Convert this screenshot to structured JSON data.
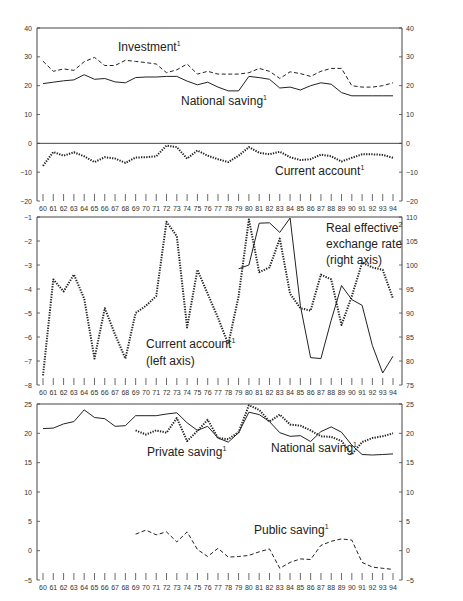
{
  "chart_data": [
    {
      "type": "line",
      "panel": "top",
      "title": "",
      "x": [
        60,
        61,
        62,
        63,
        64,
        65,
        66,
        67,
        68,
        69,
        70,
        71,
        72,
        73,
        74,
        75,
        76,
        77,
        78,
        79,
        80,
        81,
        82,
        83,
        84,
        85,
        86,
        87,
        88,
        89,
        90,
        91,
        92,
        93,
        94
      ],
      "xlabel": "",
      "ylabel": "",
      "ylim": [
        -20,
        40
      ],
      "yticks": [
        -20,
        -10,
        0,
        10,
        20,
        30,
        40
      ],
      "right_yticks": [
        -20,
        -10,
        0,
        10,
        20,
        30,
        40
      ],
      "series": [
        {
          "name": "Investment",
          "label": "Investment",
          "footnote": "1",
          "style": "dashed",
          "values": [
            28.5,
            25,
            25.8,
            25.3,
            28.3,
            29.8,
            27,
            27,
            28.8,
            28.4,
            28,
            27.5,
            24.5,
            25.5,
            27.5,
            24,
            25,
            24,
            24,
            24,
            24.5,
            26,
            25,
            22.5,
            24.8,
            24.2,
            23.2,
            25,
            26,
            26,
            20,
            19.5,
            19.5,
            20,
            21
          ]
        },
        {
          "name": "National saving",
          "label": "National saving",
          "footnote": "1",
          "style": "solid",
          "values": [
            20.7,
            21.2,
            21.7,
            22,
            23.8,
            22.2,
            22.5,
            21.3,
            21,
            22.8,
            23,
            23,
            23.2,
            23.2,
            21.6,
            20.3,
            21.2,
            19.5,
            18.2,
            18.2,
            23.2,
            22.8,
            22.2,
            19.2,
            19.5,
            18.5,
            20,
            21,
            20.5,
            17.6,
            16.5,
            16.5,
            16.5,
            16.5,
            16.5
          ]
        },
        {
          "name": "Current account",
          "label": "Current account",
          "footnote": "1",
          "style": "dotted",
          "values": [
            -7.8,
            -3,
            -4.3,
            -3.1,
            -4.5,
            -6.5,
            -4.8,
            -5.3,
            -6.8,
            -4.9,
            -4.8,
            -4.5,
            -0.8,
            -1.3,
            -5.3,
            -2.5,
            -4.3,
            -5.5,
            -6.5,
            -4.3,
            -1.3,
            -3.3,
            -3.8,
            -2.9,
            -4.8,
            -5.8,
            -5.5,
            -3.9,
            -4.5,
            -6.3,
            -5,
            -3.8,
            -3.8,
            -4,
            -5
          ]
        }
      ]
    },
    {
      "type": "line",
      "panel": "middle",
      "title": "",
      "x": [
        60,
        61,
        62,
        63,
        64,
        65,
        66,
        67,
        68,
        69,
        70,
        71,
        72,
        73,
        74,
        75,
        76,
        77,
        78,
        79,
        80,
        81,
        82,
        83,
        84,
        85,
        86,
        87,
        88,
        89,
        90,
        91,
        92,
        93,
        94
      ],
      "ylim": [
        -8,
        -1
      ],
      "yticks": [
        -8,
        -7,
        -6,
        -5,
        -4,
        -3,
        -2,
        -1
      ],
      "right_ylim": [
        75,
        110
      ],
      "right_yticks": [
        75,
        80,
        85,
        90,
        95,
        100,
        105,
        110
      ],
      "series": [
        {
          "name": "Current account",
          "label": "Current account",
          "footnote": "1",
          "sublabel": "(left axis)",
          "axis": "left",
          "style": "dotted",
          "values": [
            -7.6,
            -3.6,
            -4.1,
            -3.4,
            -4.4,
            -6.9,
            -4.8,
            -5.9,
            -6.9,
            -5,
            -4.7,
            -4.3,
            -1.2,
            -1.8,
            -5.6,
            -3.2,
            -4.2,
            -5.2,
            -6.3,
            -4.3,
            -1.1,
            -3.3,
            -3.1,
            -1.9,
            -4.2,
            -4.8,
            -4.9,
            -3.4,
            -3.6,
            -5.5,
            -4.3,
            -2.9,
            -3.1,
            -3.2,
            -4.4
          ]
        },
        {
          "name": "Real effective exchange rate",
          "label": "Real effective",
          "footnote": "2",
          "label2": "exchange rate",
          "sublabel": "(right axis)",
          "axis": "right",
          "style": "solid",
          "x_start": 79,
          "values": [
            null,
            null,
            null,
            null,
            null,
            null,
            null,
            null,
            null,
            null,
            null,
            null,
            null,
            null,
            null,
            null,
            null,
            null,
            null,
            99.2,
            100,
            108.7,
            108.8,
            106.8,
            109.8,
            91.5,
            80.7,
            80.5,
            88.5,
            95.7,
            92.8,
            91.6,
            83.2,
            77.5,
            81
          ]
        }
      ]
    },
    {
      "type": "line",
      "panel": "bottom",
      "title": "",
      "x": [
        60,
        61,
        62,
        63,
        64,
        65,
        66,
        67,
        68,
        69,
        70,
        71,
        72,
        73,
        74,
        75,
        76,
        77,
        78,
        79,
        80,
        81,
        82,
        83,
        84,
        85,
        86,
        87,
        88,
        89,
        90,
        91,
        92,
        93,
        94
      ],
      "ylim": [
        -5,
        25
      ],
      "yticks": [
        -5,
        0,
        5,
        10,
        15,
        20,
        25
      ],
      "right_yticks": [
        -5,
        0,
        5,
        10,
        15,
        20,
        25
      ],
      "series": [
        {
          "name": "National saving",
          "label": "National saving",
          "footnote": "1",
          "style": "solid",
          "values": [
            20.8,
            20.9,
            21.6,
            22,
            24,
            22.7,
            22.5,
            21.2,
            21.3,
            23,
            23,
            23,
            23.3,
            23.5,
            21.8,
            20.5,
            21.2,
            19.2,
            18.5,
            20.1,
            23.6,
            23.2,
            22,
            20.1,
            19.5,
            19.6,
            18.6,
            20.3,
            21.1,
            20.2,
            18,
            16.4,
            16.3,
            16.4,
            16.5
          ]
        },
        {
          "name": "Private saving",
          "label": "Private saving",
          "footnote": "1",
          "style": "dotted",
          "values": [
            null,
            null,
            null,
            null,
            null,
            null,
            null,
            null,
            null,
            20.5,
            19.8,
            20.5,
            20.1,
            22.6,
            18.7,
            20.4,
            22.3,
            19.2,
            19,
            20.2,
            24.8,
            24,
            22,
            23.2,
            21.5,
            21.3,
            20.5,
            19.5,
            19.4,
            18.7,
            16.4,
            18.5,
            19.2,
            19.5,
            20
          ]
        },
        {
          "name": "Public saving",
          "label": "Public saving",
          "footnote": "1",
          "style": "dashed",
          "values": [
            null,
            null,
            null,
            null,
            null,
            null,
            null,
            null,
            null,
            2.8,
            3.5,
            2.7,
            3.2,
            1.5,
            3.2,
            0.2,
            -1,
            0.4,
            -1.1,
            -1,
            -0.8,
            -0.2,
            0.3,
            -3,
            -2,
            -1.4,
            -1.5,
            0.9,
            1.6,
            2,
            1.8,
            -2,
            -2.8,
            -3,
            -3.2
          ]
        }
      ]
    }
  ],
  "labels": {
    "p1_investment": "Investment",
    "p1_national": "National saving",
    "p1_current": "Current account",
    "p2_current": "Current account",
    "p2_current_sub": "(left axis)",
    "p2_reer": "Real effective",
    "p2_reer2": "exchange rate",
    "p2_reer_sub": "(right axis)",
    "p3_private": "Private saving",
    "p3_national": "National saving",
    "p3_public": "Public saving",
    "fn1": "1",
    "fn2": "2"
  }
}
